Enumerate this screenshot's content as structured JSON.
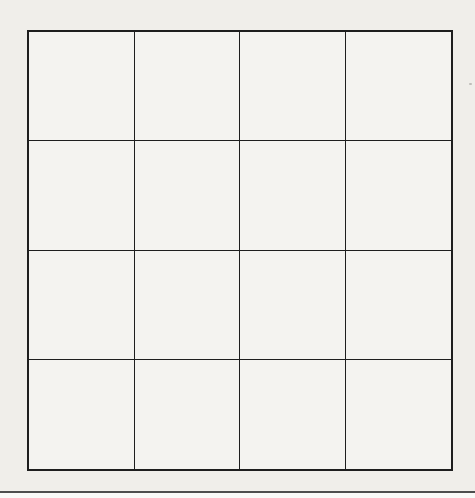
{
  "page": {
    "background_color": "#f0eeea",
    "below_edge_color": "#f9f9f7",
    "edge_line_color": "#4d4d4d"
  },
  "grid": {
    "rows": 4,
    "columns": 4,
    "line_color": "#1e1e1e",
    "cell_fill": "#f4f3f0",
    "cell_text": ""
  }
}
